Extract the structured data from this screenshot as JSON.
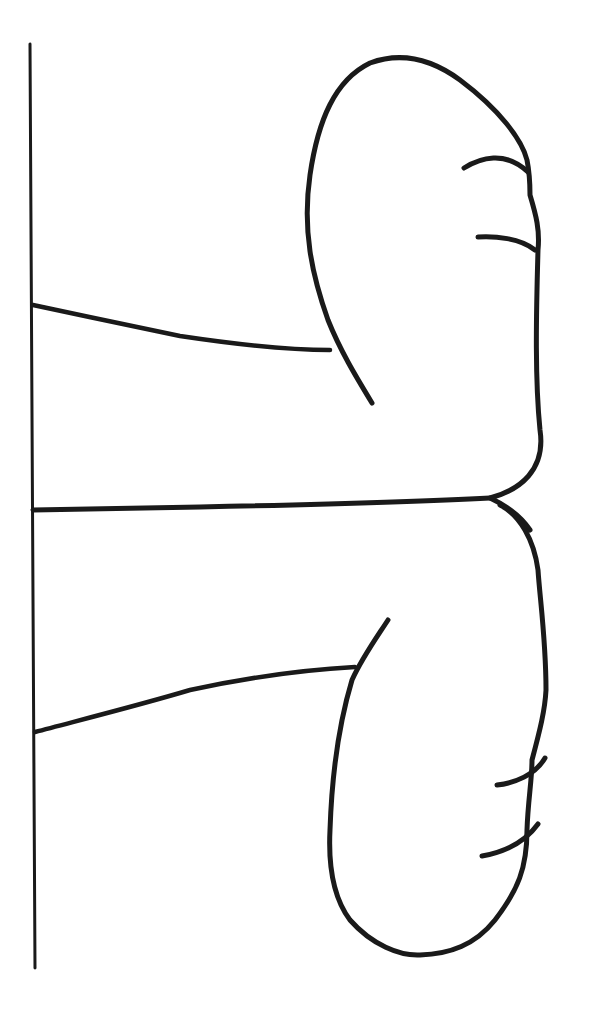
{
  "figure": {
    "stroke_color": "#1a1a1a",
    "background_color": "#ffffff",
    "elements": [
      "vertical-baseline",
      "upper-foot",
      "lower-foot",
      "upper-toe-lines",
      "lower-toe-lines",
      "leg-lines"
    ]
  }
}
